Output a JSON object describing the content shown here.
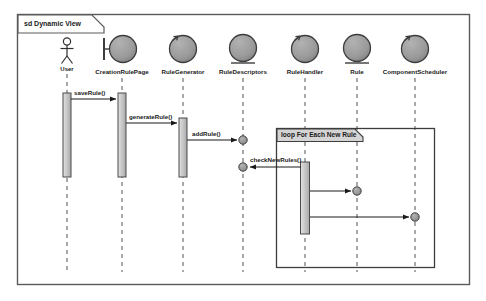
{
  "diagram": {
    "kind": "uml-sequence-diagram",
    "frame_label": "sd Dynamic View",
    "frame": {
      "x": 17,
      "y": 14,
      "width": 453,
      "height": 271
    },
    "colors": {
      "frame_stroke": "#5a5a5a",
      "icon_fill": "#9a9a9a",
      "icon_stroke": "#3d3d3d",
      "activation_fill": "#c8c8c8",
      "activation_stroke": "#4a4a4a",
      "lifeline_stroke": "#7a7a7a",
      "message_stroke": "#1a1a1a",
      "fragment_header_fill": "#d4d4d4",
      "ball_fill": "#8f8f8f",
      "text": "#1a1a1a",
      "background": "#ffffff"
    },
    "lifelines": [
      {
        "id": "user",
        "label": "User",
        "x": 67,
        "icon": "actor-stick-figure",
        "label_y": 68
      },
      {
        "id": "creationrulepage",
        "label": "CreationRulePage",
        "x": 122,
        "icon": "boundary-icon",
        "label_y": 72
      },
      {
        "id": "rulegenerator",
        "label": "RuleGenerator",
        "x": 183,
        "icon": "control-icon",
        "label_y": 72
      },
      {
        "id": "ruledescriptors",
        "label": "RuleDescriptors",
        "x": 243,
        "icon": "entity-icon",
        "label_y": 72
      },
      {
        "id": "rulehandler",
        "label": "RuleHandler",
        "x": 305,
        "icon": "control-icon",
        "label_y": 72
      },
      {
        "id": "rule",
        "label": "Rule",
        "x": 357,
        "icon": "entity-icon",
        "label_y": 72
      },
      {
        "id": "componentscheduler",
        "label": "ComponentScheduler",
        "x": 415,
        "icon": "control-icon",
        "label_y": 72
      }
    ],
    "activations": [
      {
        "id": "act-user",
        "lifeline": "user",
        "x": 63,
        "y": 93,
        "width": 8,
        "height": 84
      },
      {
        "id": "act-creationrulepage",
        "lifeline": "creationrulepage",
        "x": 118,
        "y": 93,
        "width": 8,
        "height": 84
      },
      {
        "id": "act-rulegenerator",
        "lifeline": "rulegenerator",
        "x": 179,
        "y": 118,
        "width": 8,
        "height": 59
      },
      {
        "id": "act-rulehandler",
        "lifeline": "rulehandler",
        "x": 301,
        "y": 162,
        "width": 9,
        "height": 72
      }
    ],
    "messages": [
      {
        "id": "msg-saverule",
        "label": "saveRule()",
        "from_x": 71,
        "to_x": 118,
        "y": 99,
        "direction": "right",
        "label_x": 74,
        "label_y": 93
      },
      {
        "id": "msg-generaterule",
        "label": "generateRule()",
        "from_x": 126,
        "to_x": 179,
        "y": 123,
        "direction": "right",
        "label_x": 129,
        "label_y": 117
      },
      {
        "id": "msg-addrule",
        "label": "addRule()",
        "from_x": 187,
        "to_x": 240,
        "y": 140,
        "direction": "right",
        "label_x": 192,
        "label_y": 134,
        "end_ball": true
      },
      {
        "id": "msg-checknewrules",
        "label": "checkNewRules()",
        "from_x": 301,
        "to_x": 246,
        "y": 167,
        "direction": "left",
        "label_x": 250,
        "label_y": 160,
        "end_ball": true
      },
      {
        "id": "msg-rulehandler-rule",
        "label": "",
        "from_x": 310,
        "to_x": 354,
        "y": 191,
        "direction": "right",
        "end_ball": true
      },
      {
        "id": "msg-rulehandler-scheduler",
        "label": "",
        "from_x": 310,
        "to_x": 412,
        "y": 217,
        "direction": "right",
        "end_ball": true
      }
    ],
    "fragments": [
      {
        "id": "loop-fragment",
        "operator": "loop",
        "guard": "For Each New Rule",
        "label": "loop For Each New Rule",
        "x": 276,
        "y": 128,
        "width": 159,
        "height": 140,
        "header_width": 86,
        "header_height": 13
      }
    ]
  }
}
